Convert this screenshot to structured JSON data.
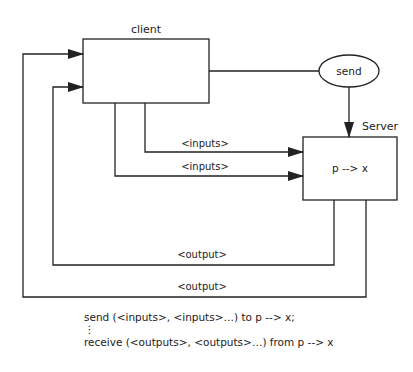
{
  "diagram": {
    "client": {
      "label": "client"
    },
    "server": {
      "label": "Server",
      "content": "p --> x"
    },
    "send_node": {
      "label": "send"
    },
    "edges": {
      "input_1": "<inputs>",
      "input_2": "<inputs>",
      "output_1": "<output>",
      "output_2": "<output>"
    },
    "colors": {
      "stroke": "#222222",
      "background": "#ffffff"
    }
  },
  "caption": {
    "line1": "send (<inputs>, <inputs>…) to p --> x;",
    "ellipsis": "⋮",
    "line3": "receive (<outputs>, <outputs>…) from p --> x"
  }
}
